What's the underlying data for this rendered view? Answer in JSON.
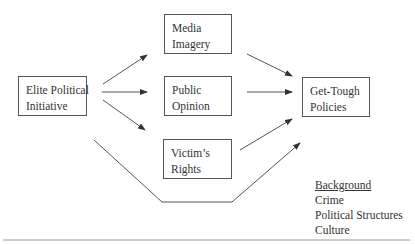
{
  "diagram": {
    "nodes": {
      "elite": {
        "line1": "Elite Political",
        "line2": "Initiative"
      },
      "media": {
        "line1": "Media",
        "line2": "Imagery"
      },
      "public": {
        "line1": "Public",
        "line2": "Opinion"
      },
      "victims": {
        "line1": "Victim’s",
        "line2": "Rights"
      },
      "policies": {
        "line1": "Get-Tough",
        "line2": "Policies"
      }
    },
    "edges": [
      {
        "from": "Elite Political Initiative",
        "to": "Media Imagery"
      },
      {
        "from": "Elite Political Initiative",
        "to": "Public Opinion"
      },
      {
        "from": "Elite Political Initiative",
        "to": "Victim's Rights"
      },
      {
        "from": "Media Imagery",
        "to": "Get-Tough Policies"
      },
      {
        "from": "Public Opinion",
        "to": "Get-Tough Policies"
      },
      {
        "from": "Victim's Rights",
        "to": "Get-Tough Policies"
      },
      {
        "from": "Elite Political Initiative",
        "to": "Get-Tough Policies",
        "note": "direct path routed below"
      }
    ],
    "background": {
      "title": "Background",
      "items": [
        "Crime",
        "Political Structures",
        "Culture"
      ]
    },
    "colors": {
      "stroke": "#555555",
      "text": "#333333",
      "rule": "#999999"
    }
  }
}
